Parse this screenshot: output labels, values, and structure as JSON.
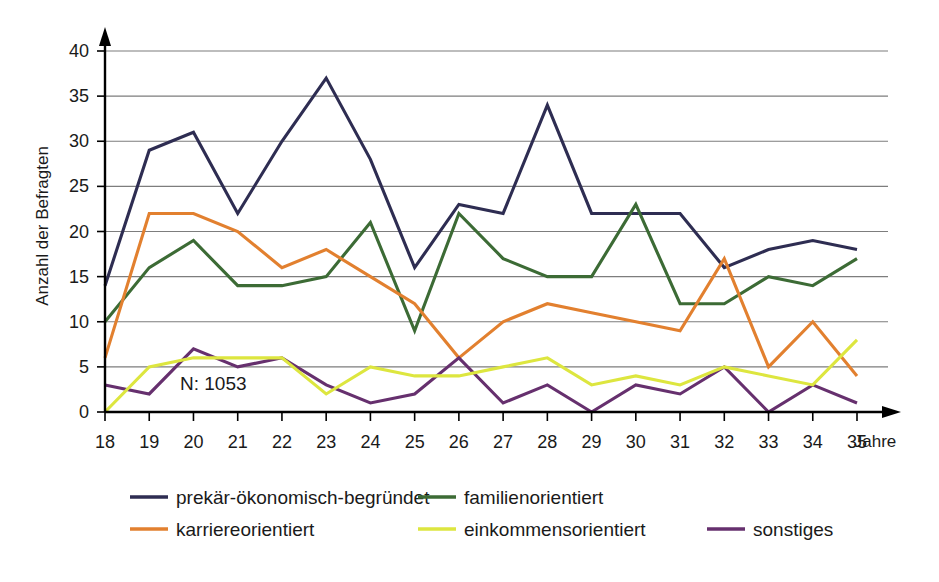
{
  "chart_data": {
    "type": "line",
    "title": "",
    "xlabel": "Jahre",
    "ylabel": "Anzahl der Befragten",
    "xlim": [
      18,
      35
    ],
    "ylim": [
      0,
      40
    ],
    "ytick_step": 5,
    "grid": true,
    "legend_position": "bottom",
    "annotation": "N: 1053",
    "categories": [
      18,
      19,
      20,
      21,
      22,
      23,
      24,
      25,
      26,
      27,
      28,
      29,
      30,
      31,
      32,
      33,
      34,
      35
    ],
    "xtick_labels": [
      "18",
      "19",
      "20",
      "21",
      "22",
      "23",
      "24",
      "25",
      "26",
      "27",
      "28",
      "29",
      "30",
      "31",
      "32",
      "33",
      "34",
      "35"
    ],
    "ytick_labels": [
      "0",
      "5",
      "10",
      "15",
      "20",
      "25",
      "30",
      "35",
      "40"
    ],
    "series": [
      {
        "name": "prekär-ökonomisch-begründet",
        "color": "#2e2d52",
        "values": [
          14,
          29,
          31,
          22,
          30,
          37,
          28,
          16,
          23,
          22,
          34,
          22,
          22,
          22,
          16,
          18,
          19,
          18
        ]
      },
      {
        "name": "karriereorientiert",
        "color": "#e2802f",
        "values": [
          6,
          22,
          22,
          20,
          16,
          18,
          15,
          12,
          6,
          10,
          12,
          11,
          10,
          9,
          17,
          5,
          10,
          4
        ]
      },
      {
        "name": "familienorientiert",
        "color": "#3c6b35",
        "values": [
          10,
          16,
          19,
          14,
          14,
          15,
          21,
          9,
          22,
          17,
          15,
          15,
          23,
          12,
          12,
          15,
          14,
          17
        ]
      },
      {
        "name": "einkommensorientiert",
        "color": "#dde63f",
        "values": [
          0,
          5,
          6,
          6,
          6,
          2,
          5,
          4,
          4,
          5,
          6,
          3,
          4,
          3,
          5,
          4,
          3,
          8
        ]
      },
      {
        "name": "sonstiges",
        "color": "#66306e",
        "values": [
          3,
          2,
          7,
          5,
          6,
          3,
          1,
          2,
          6,
          1,
          3,
          0,
          3,
          2,
          5,
          0,
          3,
          1
        ]
      }
    ]
  },
  "legend": {
    "items": [
      {
        "label": "prekär-ökonomisch-begründet",
        "color": "#2e2d52"
      },
      {
        "label": "familienorientiert",
        "color": "#3c6b35"
      },
      {
        "label": "karriereorientiert",
        "color": "#e2802f"
      },
      {
        "label": "einkommensorientiert",
        "color": "#dde63f"
      },
      {
        "label": "sonstiges",
        "color": "#66306e"
      }
    ]
  }
}
